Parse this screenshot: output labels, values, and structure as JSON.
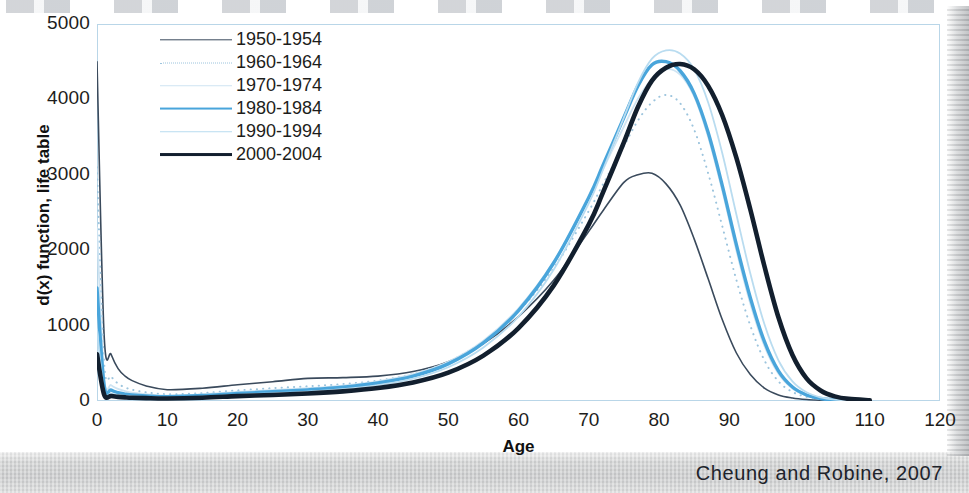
{
  "chart_data": {
    "type": "line",
    "title": "",
    "xlabel": "Age",
    "ylabel": "d(x) function, life table",
    "xlim": [
      0,
      120
    ],
    "ylim": [
      0,
      5000
    ],
    "xticks": [
      "0",
      "10",
      "20",
      "30",
      "40",
      "50",
      "60",
      "70",
      "80",
      "90",
      "100",
      "110",
      "120"
    ],
    "yticks": [
      "0",
      "1000",
      "2000",
      "3000",
      "4000",
      "5000"
    ],
    "grid": false,
    "legend_position": "top-left-inside",
    "x": [
      0,
      1,
      2,
      3,
      4,
      5,
      7,
      10,
      15,
      20,
      25,
      30,
      35,
      40,
      45,
      50,
      55,
      60,
      65,
      70,
      72,
      75,
      77,
      79,
      81,
      83,
      85,
      87,
      89,
      91,
      93,
      95,
      97,
      99,
      101,
      103,
      105,
      107,
      110
    ],
    "series": [
      {
        "name": "1950-1954",
        "color": "#3a4a5c",
        "width": 1.6,
        "dash": "none",
        "values": [
          4500,
          900,
          620,
          430,
          330,
          270,
          200,
          150,
          170,
          215,
          255,
          300,
          310,
          330,
          390,
          520,
          760,
          1120,
          1600,
          2250,
          2520,
          2900,
          3000,
          3020,
          2880,
          2600,
          2150,
          1620,
          1080,
          640,
          350,
          170,
          80,
          40,
          20,
          10,
          5,
          2,
          0
        ]
      },
      {
        "name": "1960-1964",
        "color": "#9cc4dd",
        "width": 2.0,
        "dash": "dotted",
        "values": [
          3100,
          520,
          330,
          230,
          180,
          150,
          115,
          90,
          105,
          140,
          170,
          195,
          225,
          270,
          360,
          520,
          790,
          1190,
          1760,
          2520,
          2870,
          3380,
          3720,
          3960,
          4060,
          3950,
          3600,
          3020,
          2320,
          1610,
          1000,
          540,
          260,
          120,
          55,
          25,
          10,
          4,
          0
        ]
      },
      {
        "name": "1970-1974",
        "color": "#cfe4f2",
        "width": 1.8,
        "dash": "none",
        "values": [
          2300,
          330,
          210,
          160,
          130,
          110,
          90,
          72,
          88,
          120,
          145,
          170,
          205,
          260,
          355,
          520,
          800,
          1230,
          1850,
          2680,
          3070,
          3640,
          4010,
          4270,
          4400,
          4330,
          4040,
          3500,
          2790,
          2000,
          1290,
          730,
          360,
          165,
          70,
          30,
          12,
          5,
          0
        ]
      },
      {
        "name": "1980-1984",
        "color": "#49a5db",
        "width": 3.4,
        "dash": "none",
        "values": [
          1500,
          220,
          145,
          110,
          92,
          80,
          68,
          58,
          72,
          100,
          122,
          148,
          182,
          238,
          330,
          492,
          770,
          1200,
          1830,
          2700,
          3120,
          3760,
          4180,
          4460,
          4500,
          4380,
          4080,
          3560,
          2860,
          2080,
          1370,
          790,
          400,
          185,
          80,
          33,
          13,
          5,
          0
        ]
      },
      {
        "name": "1990-1994",
        "color": "#b9dcf0",
        "width": 1.8,
        "dash": "none",
        "values": [
          950,
          140,
          98,
          80,
          68,
          60,
          52,
          45,
          58,
          82,
          102,
          125,
          158,
          210,
          296,
          448,
          710,
          1120,
          1740,
          2620,
          3060,
          3760,
          4220,
          4540,
          4650,
          4610,
          4400,
          3960,
          3290,
          2480,
          1690,
          1020,
          540,
          260,
          115,
          48,
          18,
          7,
          0
        ]
      },
      {
        "name": "2000-2004",
        "color": "#121f2e",
        "width": 4.6,
        "dash": "none",
        "values": [
          620,
          90,
          65,
          55,
          48,
          43,
          38,
          34,
          44,
          64,
          80,
          100,
          128,
          172,
          246,
          376,
          602,
          968,
          1530,
          2340,
          2760,
          3430,
          3900,
          4250,
          4420,
          4470,
          4400,
          4180,
          3790,
          3230,
          2540,
          1790,
          1110,
          610,
          300,
          140,
          62,
          28,
          10
        ]
      }
    ]
  },
  "legend": {
    "items": [
      {
        "label": "1950-1954"
      },
      {
        "label": "1960-1964"
      },
      {
        "label": "1970-1974"
      },
      {
        "label": "1980-1984"
      },
      {
        "label": "1990-1994"
      },
      {
        "label": "2000-2004"
      }
    ]
  },
  "axes": {
    "x_title": "Age",
    "y_title": "d(x) function, life table"
  },
  "citation": "Cheung and Robine, 2007",
  "colors": {
    "plot_border": "#b9d6e8",
    "text": "#1d1d1b",
    "accent_blue": "#49a5db",
    "dark_navy": "#121f2e"
  }
}
